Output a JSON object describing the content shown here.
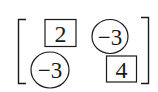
{
  "matrix": {
    "rows": 2,
    "cols": 2,
    "cells": [
      {
        "row": 0,
        "col": 0,
        "value": "2",
        "shape": "square"
      },
      {
        "row": 0,
        "col": 1,
        "value": "−3",
        "shape": "circle"
      },
      {
        "row": 1,
        "col": 0,
        "value": "−3",
        "shape": "circle"
      },
      {
        "row": 1,
        "col": 1,
        "value": "4",
        "shape": "square"
      }
    ],
    "bracket_style": "square",
    "stroke_color": "#1a1a1a",
    "background": "#ffffff"
  }
}
